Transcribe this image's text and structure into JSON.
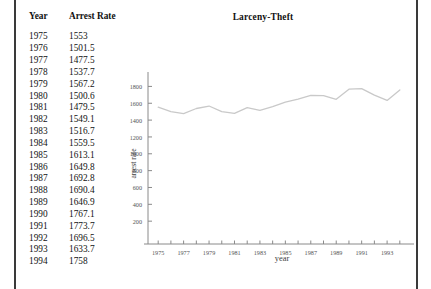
{
  "table": {
    "headers": [
      "Year",
      "Arrest Rate"
    ],
    "rows": [
      [
        "1975",
        "1553"
      ],
      [
        "1976",
        "1501.5"
      ],
      [
        "1977",
        "1477.5"
      ],
      [
        "1978",
        "1537.7"
      ],
      [
        "1979",
        "1567.2"
      ],
      [
        "1980",
        "1500.6"
      ],
      [
        "1981",
        "1479.5"
      ],
      [
        "1982",
        "1549.1"
      ],
      [
        "1983",
        "1516.7"
      ],
      [
        "1984",
        "1559.5"
      ],
      [
        "1985",
        "1613.1"
      ],
      [
        "1986",
        "1649.8"
      ],
      [
        "1987",
        "1692.8"
      ],
      [
        "1988",
        "1690.4"
      ],
      [
        "1989",
        "1646.9"
      ],
      [
        "1990",
        "1767.1"
      ],
      [
        "1991",
        "1773.7"
      ],
      [
        "1992",
        "1696.5"
      ],
      [
        "1993",
        "1633.7"
      ],
      [
        "1994",
        "1758"
      ]
    ]
  },
  "chart_data": {
    "type": "line",
    "title": "Larceny-Theft",
    "xlabel": "year",
    "ylabel": "arrest rate",
    "x": [
      1975,
      1976,
      1977,
      1978,
      1979,
      1980,
      1981,
      1982,
      1983,
      1984,
      1985,
      1986,
      1987,
      1988,
      1989,
      1990,
      1991,
      1992,
      1993,
      1994
    ],
    "values": [
      1553,
      1501.5,
      1477.5,
      1537.7,
      1567.2,
      1500.6,
      1479.5,
      1549.1,
      1516.7,
      1559.5,
      1613.1,
      1649.8,
      1692.8,
      1690.4,
      1646.9,
      1767.1,
      1773.7,
      1696.5,
      1633.7,
      1758
    ],
    "xticks": [
      1975,
      1977,
      1979,
      1981,
      1983,
      1985,
      1987,
      1989,
      1991,
      1993
    ],
    "xticklabels": [
      "1975",
      "1977",
      "1979",
      "1981",
      "1983",
      "1985",
      "1987",
      "1989",
      "1991",
      "1993"
    ],
    "yticks": [
      200,
      400,
      600,
      800,
      1000,
      1200,
      1400,
      1600,
      1800
    ],
    "yticklabels": [
      "200",
      "400",
      "600",
      "800",
      "1000",
      "1200",
      "1400",
      "1600",
      "1800"
    ],
    "xlim": [
      1974.2,
      1994.8
    ],
    "ylim": [
      0,
      1900
    ],
    "grid": false,
    "legend": null,
    "line_color": "#c9c9c9"
  }
}
